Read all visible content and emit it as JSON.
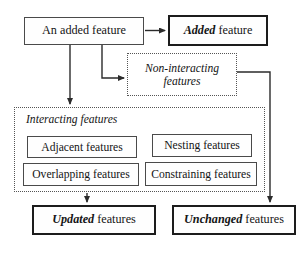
{
  "diagram": {
    "type": "flowchart",
    "background_color": "#ffffff",
    "line_color": "#2b2b2b",
    "nodes": {
      "added_source": {
        "label": "An added feature",
        "style": "solid-thin"
      },
      "added_result": {
        "emphasis": "Added",
        "rest": " feature",
        "style": "solid-thick"
      },
      "noninteracting": {
        "line1": "Non-interacting",
        "line2": "features",
        "style": "dotted"
      },
      "interacting_group": {
        "label": "Interacting features",
        "style": "dotted"
      },
      "adjacent": {
        "label": "Adjacent features",
        "style": "solid-thin"
      },
      "nesting": {
        "label": "Nesting features",
        "style": "solid-thin"
      },
      "overlapping": {
        "label": "Overlapping features",
        "style": "solid-thin"
      },
      "constraining": {
        "label": "Constraining features",
        "style": "solid-thin"
      },
      "updated": {
        "emphasis": "Updated",
        "rest": " features",
        "style": "solid-thick"
      },
      "unchanged": {
        "emphasis": "Unchanged",
        "rest": " features",
        "style": "solid-thick"
      }
    },
    "edges": [
      {
        "from": "added_source",
        "to": "added_result",
        "arrow": true
      },
      {
        "from": "added_source",
        "to": "noninteracting",
        "arrow": true
      },
      {
        "from": "added_source",
        "to": "interacting_group",
        "arrow": true
      },
      {
        "from": "interacting_group",
        "to": "updated",
        "arrow": true
      },
      {
        "from": "noninteracting",
        "to": "unchanged",
        "arrow": true
      }
    ]
  }
}
